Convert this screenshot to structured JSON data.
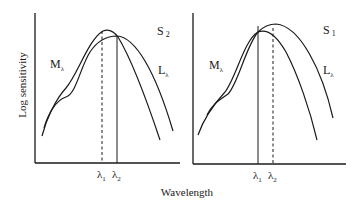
{
  "figure": {
    "y_axis_label": "Log sensitivity",
    "x_axis_label": "Wavelength",
    "panels": [
      {
        "id": "left",
        "label_main": "S",
        "label_sub": "2",
        "curve_m": {
          "main": "M",
          "sub": "λ"
        },
        "curve_l": {
          "main": "L",
          "sub": "λ"
        },
        "markers": [
          {
            "main": "λ",
            "sub": "1",
            "style": "dashed"
          },
          {
            "main": "λ",
            "sub": "2",
            "style": "solid"
          }
        ]
      },
      {
        "id": "right",
        "label_main": "S",
        "label_sub": "1",
        "curve_m": {
          "main": "M",
          "sub": "λ"
        },
        "curve_l": {
          "main": "L",
          "sub": "λ"
        },
        "markers": [
          {
            "main": "λ",
            "sub": "1",
            "style": "solid"
          },
          {
            "main": "λ",
            "sub": "2",
            "style": "dashed"
          }
        ]
      }
    ]
  },
  "colors": {
    "ink": "#1a1a1a",
    "background": "#ffffff"
  }
}
